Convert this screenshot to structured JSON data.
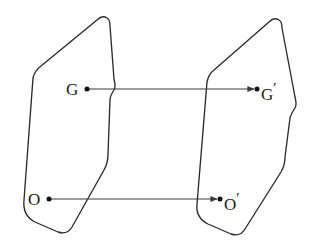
{
  "figure": {
    "type": "mapping-diagram",
    "background_color": "#ffffff",
    "stroke_color": "#2b2b2b",
    "arrow_color": "#3a3a3a",
    "point_color": "#111111"
  },
  "labels": {
    "G": "G",
    "O": "O",
    "G_prime_base": "G",
    "O_prime_base": "O",
    "prime_mark": "′"
  },
  "shapes": [
    {
      "name": "left-region",
      "outline_path": "M 107 18 C 104 16 100 17 97 20 L 41 66 C 37 69 34 73 33 78 L 24 200 C 23 210 27 218 35 222 L 58 232 C 64 234 69 232 72 227 L 104 170 C 107 165 108 160 108 154 L 110 100 C 110 96 112 93 114 90 C 116 87 115 83 114 79 L 110 26 C 110 22 109 19 107 18 Z"
    },
    {
      "name": "right-region",
      "outline_path": "M 279 20 C 276 18 272 19 269 22 L 214 70 C 210 73 208 77 207 82 L 197 204 C 196 213 200 220 208 224 L 231 234 C 237 236 242 234 245 229 L 281 172 C 284 167 285 162 285 157 L 290 118 C 291 114 293 111 295 108 C 297 105 296 101 295 97 L 282 28 C 282 24 281 21 279 20 Z"
    }
  ],
  "points": [
    {
      "name": "point-G",
      "label": "G",
      "cx": 87,
      "cy": 89
    },
    {
      "name": "point-Gp",
      "label": "G′",
      "cx": 257,
      "cy": 89
    },
    {
      "name": "point-O",
      "label": "O",
      "cx": 49,
      "cy": 199
    },
    {
      "name": "point-Op",
      "label": "O′",
      "cx": 220,
      "cy": 199
    }
  ],
  "arrows": [
    {
      "name": "arrow-G-to-Gprime",
      "from_label": "G",
      "to_label": "G′",
      "x1": 88,
      "y1": 89,
      "x2": 254,
      "y2": 89
    },
    {
      "name": "arrow-O-to-Oprime",
      "from_label": "O",
      "to_label": "O′",
      "x1": 50,
      "y1": 199,
      "x2": 217,
      "y2": 199
    }
  ]
}
